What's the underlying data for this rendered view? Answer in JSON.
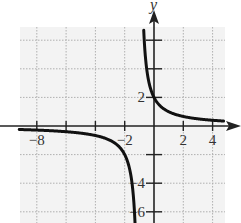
{
  "chart_data": {
    "type": "line",
    "title": "",
    "xlabel": "",
    "ylabel": "y",
    "xlim": [
      -9,
      5
    ],
    "ylim": [
      -6.8,
      6.8
    ],
    "grid": true,
    "grid_step": 2,
    "x_tick_labels": [
      {
        "value": -8,
        "label": "−8"
      },
      {
        "value": -2,
        "label": "−2"
      },
      {
        "value": 2,
        "label": "2"
      },
      {
        "value": 4,
        "label": "4"
      }
    ],
    "y_tick_labels": [
      {
        "value": 2,
        "label": "2"
      },
      {
        "value": -4,
        "label": "−4"
      },
      {
        "value": -6,
        "label": "−6"
      }
    ],
    "series": [
      {
        "name": "f(x) = 2/(x+1)",
        "description": "Rational function with vertical asymptote x = -1 and horizontal asymptote y = 0",
        "asymptotes": {
          "vertical": -1,
          "horizontal": 0
        },
        "branches": [
          {
            "x": [
              -9,
              -8,
              -6,
              -4,
              -3,
              -2,
              -1.5,
              -1.3
            ],
            "y": [
              -0.25,
              -0.29,
              -0.4,
              -0.67,
              -1,
              -2,
              -4,
              -6.67
            ]
          },
          {
            "x": [
              -0.7,
              -0.5,
              0,
              1,
              2,
              3,
              4,
              5
            ],
            "y": [
              6.67,
              4,
              2,
              1,
              0.67,
              0.5,
              0.4,
              0.33
            ]
          }
        ]
      }
    ]
  },
  "colors": {
    "grid_background": "#f3f3f3",
    "grid_line": "#b0b0b0",
    "axis": "#222222",
    "curve": "#111111"
  },
  "labels": {
    "y_axis": "y"
  }
}
